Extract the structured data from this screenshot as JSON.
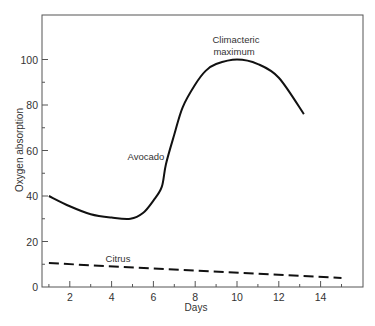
{
  "chart_data": {
    "type": "line",
    "title": "",
    "xlabel": "Days",
    "ylabel": "Oxygen absorption",
    "xlim": [
      0.6,
      16.0
    ],
    "ylim": [
      0,
      120
    ],
    "x_ticks": [
      2,
      4,
      6,
      8,
      10,
      12,
      14
    ],
    "x_minor_ticks": [
      1,
      3,
      5,
      7,
      9,
      11,
      13,
      15
    ],
    "y_ticks": [
      0,
      20,
      40,
      60,
      80,
      100
    ],
    "y_minor_ticks": [
      10,
      30,
      50,
      70,
      90
    ],
    "grid": false,
    "legend": null,
    "series": [
      {
        "name": "Avocado",
        "style": "solid",
        "color": "#111111",
        "x": [
          1,
          2,
          3,
          4,
          4.9,
          5.5,
          6,
          6.4,
          6.6,
          7,
          7.4,
          8,
          8.5,
          9,
          10,
          11,
          12,
          13.2
        ],
        "values": [
          40,
          35.5,
          32,
          30.5,
          30,
          32.5,
          38,
          44,
          54,
          67,
          79,
          89,
          95,
          98,
          100,
          98,
          92,
          76
        ]
      },
      {
        "name": "Citrus",
        "style": "dashed",
        "color": "#111111",
        "x": [
          1,
          15
        ],
        "values": [
          10.5,
          4
        ]
      }
    ],
    "annotations": [
      {
        "text": "Avocado",
        "x": 6.0,
        "y": 57
      },
      {
        "text": "Citrus",
        "x": 4.6,
        "y": 12
      },
      {
        "text": "Climacteric",
        "x": 10.0,
        "y": 108
      },
      {
        "text": "maximum",
        "x": 10.0,
        "y": 103
      }
    ]
  },
  "labels": {
    "xlabel": "Days",
    "ylabel": "Oxygen absorption",
    "avocado": "Avocado",
    "citrus": "Citrus",
    "climacteric_line1": "Climacteric",
    "climacteric_line2": "maximum"
  }
}
